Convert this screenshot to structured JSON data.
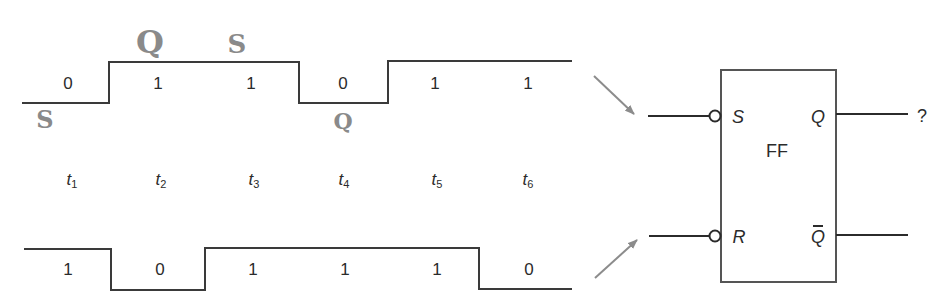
{
  "diagram": {
    "type": "timing-diagram-with-flip-flop",
    "time_labels": [
      {
        "base": "t",
        "sub": "1",
        "x": 72
      },
      {
        "base": "t",
        "sub": "2",
        "x": 161
      },
      {
        "base": "t",
        "sub": "3",
        "x": 254
      },
      {
        "base": "t",
        "sub": "4",
        "x": 344
      },
      {
        "base": "t",
        "sub": "5",
        "x": 437
      },
      {
        "base": "t",
        "sub": "6",
        "x": 528
      }
    ],
    "s_waveform": {
      "values": [
        "0",
        "1",
        "1",
        "0",
        "1",
        "1"
      ],
      "label_x": [
        68,
        158,
        251,
        343,
        435,
        528
      ],
      "label_y": 83
    },
    "r_waveform": {
      "values": [
        "1",
        "0",
        "1",
        "1",
        "1",
        "0"
      ],
      "label_x": [
        68,
        160,
        253,
        345,
        437,
        529
      ],
      "label_y": 269
    },
    "annotations": {
      "handwritten_q_top": "Q",
      "handwritten_s_top": "S",
      "handwritten_s_left": "S",
      "handwritten_q_mid": "Q"
    },
    "flip_flop": {
      "name": "FF",
      "inputs": {
        "set": "S",
        "reset": "R"
      },
      "outputs": {
        "q": "Q",
        "q_bar": "Q"
      },
      "q_output_value": "?"
    },
    "colors": {
      "line": "#3a3a3a",
      "arrow": "#8c8c8c",
      "handwriting": "#8a8a8a",
      "text": "#2b2b2b"
    }
  }
}
